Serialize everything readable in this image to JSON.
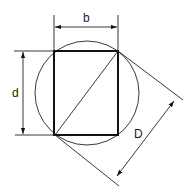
{
  "diagram": {
    "labels": {
      "width": "b",
      "height": "d",
      "diameter": "D"
    },
    "colors": {
      "stroke": "#111111",
      "background": "#ffffff"
    },
    "shapes": {
      "circle": {
        "cx": 87,
        "cy": 93,
        "r": 52
      },
      "rectangle": {
        "x1": 54,
        "y1": 51,
        "x2": 118,
        "y2": 135
      }
    }
  }
}
